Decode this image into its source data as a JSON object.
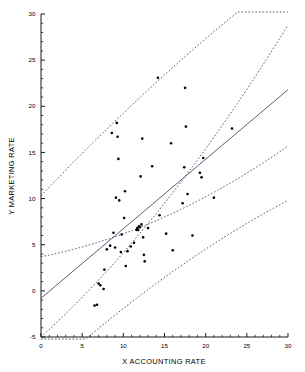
{
  "chart_data": {
    "type": "scatter",
    "title": "",
    "xlabel": "X ACCOUNTING RATE",
    "ylabel": "Y MARKETING RATE",
    "xlim": [
      0,
      30
    ],
    "ylim": [
      -5,
      30
    ],
    "grid": false,
    "legend": null,
    "x_ticks": [
      0,
      5,
      10,
      15,
      20,
      25,
      30
    ],
    "x_tick_labels": [
      "0",
      "5",
      "10",
      "15",
      "20",
      "25",
      "30"
    ],
    "y_ticks": [
      -5,
      0,
      5,
      10,
      15,
      20,
      25,
      30
    ],
    "y_tick_labels": [
      "-5",
      "0",
      "5",
      "10",
      "15",
      "20",
      "25",
      "30"
    ],
    "x_minor_step": 1,
    "y_minor_step": 1,
    "point_color": "#000000",
    "regression_color": "#4a4a6a",
    "band_color": "#3a3a5c",
    "points": [
      [
        6.5,
        -1.6
      ],
      [
        6.8,
        -1.5
      ],
      [
        7.0,
        0.8
      ],
      [
        7.2,
        0.6
      ],
      [
        7.6,
        0.2
      ],
      [
        7.7,
        2.3
      ],
      [
        8.0,
        4.5
      ],
      [
        8.4,
        4.9
      ],
      [
        8.6,
        17.1
      ],
      [
        8.8,
        6.3
      ],
      [
        9.0,
        4.7
      ],
      [
        9.1,
        10.1
      ],
      [
        9.2,
        18.2
      ],
      [
        9.3,
        16.7
      ],
      [
        9.4,
        14.3
      ],
      [
        9.5,
        9.8
      ],
      [
        9.7,
        4.2
      ],
      [
        9.8,
        6.1
      ],
      [
        10.1,
        7.9
      ],
      [
        10.2,
        10.8
      ],
      [
        10.3,
        2.7
      ],
      [
        10.5,
        4.3
      ],
      [
        10.9,
        4.8
      ],
      [
        11.3,
        5.2
      ],
      [
        11.6,
        6.6
      ],
      [
        11.7,
        6.8
      ],
      [
        11.8,
        6.6
      ],
      [
        11.9,
        7.0
      ],
      [
        12.0,
        6.9
      ],
      [
        12.1,
        12.4
      ],
      [
        12.2,
        7.2
      ],
      [
        12.3,
        16.5
      ],
      [
        12.4,
        5.8
      ],
      [
        12.5,
        3.9
      ],
      [
        12.6,
        3.2
      ],
      [
        13.0,
        6.8
      ],
      [
        13.5,
        13.5
      ],
      [
        14.2,
        23.1
      ],
      [
        14.4,
        8.2
      ],
      [
        15.2,
        6.2
      ],
      [
        15.8,
        16.0
      ],
      [
        16.0,
        4.4
      ],
      [
        17.2,
        9.5
      ],
      [
        17.4,
        13.4
      ],
      [
        17.5,
        22.0
      ],
      [
        17.6,
        17.8
      ],
      [
        17.8,
        10.5
      ],
      [
        18.4,
        6.0
      ],
      [
        19.3,
        12.8
      ],
      [
        19.5,
        12.3
      ],
      [
        19.7,
        14.4
      ],
      [
        21.0,
        10.1
      ],
      [
        23.2,
        17.6
      ]
    ],
    "regression_line": {
      "name": "fitted regression line",
      "x": [
        0,
        30
      ],
      "y": [
        -0.8,
        21.8
      ]
    },
    "bands": [
      {
        "name": "upper outer prediction band",
        "x": [
          0,
          30
        ],
        "y": [
          10.3,
          34.5
        ],
        "curved": true
      },
      {
        "name": "upper inner confidence band",
        "x": [
          0,
          30
        ],
        "y": [
          -5.0,
          28.8
        ],
        "curved": true
      },
      {
        "name": "lower inner confidence band",
        "x": [
          0,
          30
        ],
        "y": [
          3.7,
          15.7
        ],
        "curved": true
      },
      {
        "name": "lower outer prediction band",
        "x": [
          0,
          30
        ],
        "y": [
          -9.5,
          9.8
        ],
        "curved": true
      }
    ]
  }
}
